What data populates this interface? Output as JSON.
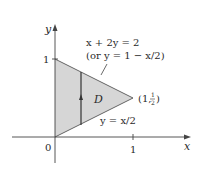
{
  "diagram": {
    "axes": {
      "x_label": "x",
      "y_label": "y",
      "origin_label": "0",
      "x_tick_label": "1",
      "y_tick_label": "1"
    },
    "region": {
      "label": "D",
      "fill": "#d6d6d6",
      "vertices": [
        [
          0,
          0
        ],
        [
          0,
          1
        ],
        [
          1,
          0.5
        ]
      ]
    },
    "upper_boundary": {
      "equation": "x + 2y = 2",
      "alt_equation": "(or y = 1 − x/2)"
    },
    "lower_boundary": {
      "equation": "y = x/2"
    },
    "apex_point": {
      "label_prefix": "(1, ",
      "frac_num": "1",
      "frac_den": "2",
      "label_suffix": ")"
    },
    "line_color": "#333333"
  }
}
